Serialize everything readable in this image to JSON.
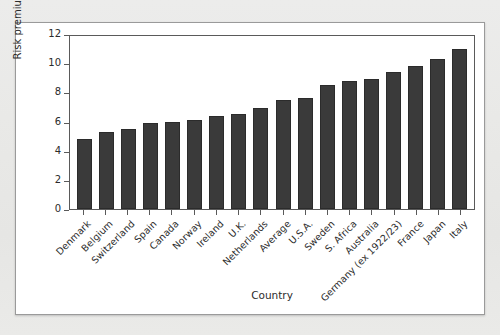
{
  "figure": {
    "background_color": "#ffffff",
    "page_color": "#e8e8e6",
    "bar_color": "#3a3a3a",
    "axis_color": "#5a5a5a"
  },
  "chart_data": {
    "type": "bar",
    "title": "",
    "xlabel": "Country",
    "ylabel": "Risk premium, %",
    "ylim": [
      0,
      12
    ],
    "yticks": [
      0,
      2,
      4,
      6,
      8,
      10,
      12
    ],
    "grid": false,
    "legend": null,
    "categories": [
      "Denmark",
      "Belgium",
      "Switzerland",
      "Spain",
      "Canada",
      "Norway",
      "Ireland",
      "U.K.",
      "Netherlands",
      "Average",
      "U.S.A.",
      "Sweden",
      "S. Africa",
      "Australia",
      "Germany (ex 1922/23)",
      "France",
      "Japan",
      "Italy"
    ],
    "values": [
      4.8,
      5.3,
      5.5,
      5.9,
      6.0,
      6.1,
      6.4,
      6.5,
      6.9,
      7.5,
      7.6,
      8.5,
      8.8,
      8.9,
      9.4,
      9.8,
      10.3,
      11.0
    ]
  }
}
